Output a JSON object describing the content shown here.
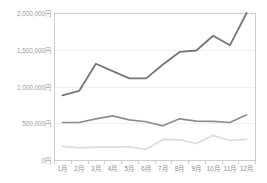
{
  "chart_data": {
    "type": "line",
    "title": "",
    "subtitle": "",
    "xlabel": "",
    "ylabel": "",
    "categories": [
      "1月",
      "2月",
      "3月",
      "4月",
      "5月",
      "6月",
      "7月",
      "8月",
      "9月",
      "10月",
      "11月",
      "12月"
    ],
    "ylim": [
      0,
      2000000
    ],
    "yticks": [
      0,
      500000,
      1000000,
      1500000,
      2000000
    ],
    "ytick_labels": [
      "0円",
      "500,000円",
      "1,000,000円",
      "1,500,000円",
      "2,000,000円"
    ],
    "grid": true,
    "grid_axis": "y",
    "legend": false,
    "legend_position": "none",
    "series": [
      {
        "name": "series-1",
        "color": "#767676",
        "width": 1.8,
        "values": [
          880000,
          940000,
          1310000,
          1210000,
          1110000,
          1110000,
          1300000,
          1470000,
          1490000,
          1690000,
          1560000,
          2000000
        ]
      },
      {
        "name": "series-2",
        "color": "#8d8d8d",
        "width": 1.7,
        "values": [
          510000,
          510000,
          560000,
          600000,
          545000,
          520000,
          465000,
          560000,
          530000,
          525000,
          510000,
          615000
        ]
      },
      {
        "name": "series-3",
        "color": "#dcdcdc",
        "width": 1.7,
        "values": [
          185000,
          165000,
          175000,
          175000,
          180000,
          145000,
          280000,
          275000,
          225000,
          335000,
          265000,
          280000
        ]
      }
    ]
  },
  "axes": {
    "y_axis_name": "y-axis",
    "x_axis_name": "x-axis"
  },
  "colors": {
    "grid": "#ebebeb",
    "border": "#c9c9c9",
    "tick_text": "#9a9a9a",
    "background": "#ffffff"
  },
  "plot": {
    "left": 54,
    "top": 13,
    "right": 255,
    "bottom": 160
  }
}
